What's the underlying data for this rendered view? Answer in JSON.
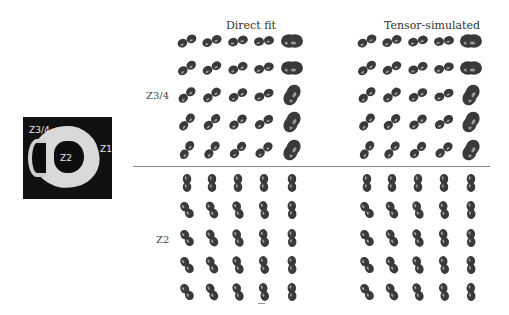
{
  "inset": {
    "labels": {
      "z34": "Z3/4",
      "z2": "Z2",
      "z1": "Z1"
    }
  },
  "panels": {
    "direct_fit": {
      "title": "Direct fit"
    },
    "tensor_simulated": {
      "title": "Tensor-simulated"
    }
  },
  "rows": {
    "top": {
      "label": "Z3/4"
    },
    "bottom": {
      "label": "Z2"
    }
  },
  "grid": {
    "rows_per_section": 5,
    "cols_per_panel": 5,
    "glyph_color": "#3a3a3a",
    "highlight_color": "#9a9a9a"
  }
}
